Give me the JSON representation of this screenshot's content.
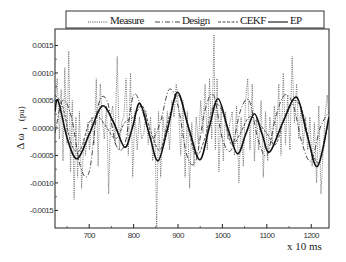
{
  "chart_data": {
    "type": "line",
    "title": "",
    "xlabel": "x 10 ms",
    "ylabel": "Δω 1 (pu)",
    "ylabel_main": "Δ ω",
    "ylabel_sub": "1",
    "ylabel_unit": "(pu)",
    "xlim": [
      623,
      1240
    ],
    "ylim": [
      -0.00182,
      0.0018
    ],
    "x_ticks": [
      700,
      800,
      900,
      1000,
      1100,
      1200
    ],
    "x_tick_labels": [
      "700",
      "800",
      "900",
      "1000",
      "1100",
      "1200"
    ],
    "y_ticks": [
      0.0015,
      0.001,
      0.0005,
      0.0,
      -0.0005,
      -0.001,
      -0.0015
    ],
    "y_tick_labels": [
      "0.0015",
      "0.0010",
      "0.0005",
      "0.0000",
      "-0.0005",
      "-0.0010",
      "-0.0015"
    ],
    "grid": false,
    "legend_position": "top",
    "series": [
      {
        "name": "Measure",
        "style": "dotted",
        "color": "#555555",
        "x": [
          623,
          628,
          633,
          637,
          641,
          645,
          650,
          654,
          658,
          662,
          666,
          670,
          674,
          678,
          683,
          688,
          692,
          697,
          701,
          706,
          711,
          716,
          720,
          725,
          730,
          734,
          739,
          744,
          748,
          753,
          758,
          763,
          768,
          773,
          778,
          783,
          788,
          793,
          798,
          803,
          808,
          813,
          818,
          823,
          828,
          833,
          838,
          843,
          848,
          852,
          856,
          861,
          866,
          871,
          876,
          881,
          886,
          891,
          896,
          901,
          906,
          911,
          916,
          921,
          926,
          931,
          936,
          941,
          946,
          951,
          956,
          961,
          966,
          971,
          976,
          981,
          984,
          988,
          992,
          997,
          1002,
          1007,
          1012,
          1017,
          1022,
          1027,
          1032,
          1037,
          1042,
          1047,
          1052,
          1057,
          1062,
          1067,
          1072,
          1077,
          1082,
          1087,
          1092,
          1097,
          1102,
          1107,
          1112,
          1117,
          1122,
          1127,
          1132,
          1137,
          1142,
          1147,
          1152,
          1157,
          1162,
          1167,
          1172,
          1177,
          1182,
          1187,
          1192,
          1197,
          1202,
          1207,
          1212,
          1217,
          1222,
          1227,
          1232,
          1236,
          1240
        ],
        "y": [
          0.0004,
          0.0009,
          -0.0002,
          0.0007,
          -0.0006,
          0.0011,
          -0.0003,
          0.0014,
          -0.0008,
          0.0005,
          -0.0013,
          0.0002,
          -0.0009,
          0.0003,
          -0.0011,
          -0.0002,
          -0.0005,
          0.0001,
          -0.0004,
          0.0002,
          -0.0003,
          0.0009,
          -0.0007,
          0.0008,
          0.0001,
          -0.0002,
          0.0004,
          -0.0012,
          0.0002,
          0.0004,
          -0.0003,
          0.0013,
          -0.0004,
          0.0001,
          0.0002,
          0.0009,
          -0.0005,
          0.001,
          -0.0009,
          0.0003,
          -0.0004,
          0.0002,
          -0.0002,
          -0.0001,
          0.0003,
          -0.0003,
          0.0002,
          -0.0006,
          0.0,
          -0.0018,
          0.0003,
          -0.0009,
          0.0002,
          -0.0002,
          0.0003,
          -0.0004,
          0.0005,
          0.0002,
          0.0008,
          0.0004,
          -0.0005,
          0.0005,
          -0.0009,
          0.0003,
          -0.0011,
          0.0001,
          -0.0007,
          0.0002,
          -0.0003,
          0.0005,
          -0.0001,
          0.0008,
          -0.0004,
          0.0009,
          -0.0002,
          0.0017,
          -0.0004,
          0.0009,
          -0.0008,
          0.0004,
          -0.0006,
          0.0003,
          -0.0002,
          0.0001,
          0.0003,
          -0.0005,
          0.0004,
          -0.001,
          0.0002,
          -0.0007,
          0.0005,
          0.0009,
          -0.0004,
          0.0008,
          -0.0006,
          0.0002,
          -0.0004,
          0.0005,
          -0.0009,
          0.0003,
          -0.0006,
          0.0002,
          -0.0003,
          0.0004,
          -0.0002,
          0.0008,
          -0.0005,
          0.001,
          -0.0003,
          0.0006,
          -0.0004,
          0.0013,
          0.0001,
          0.0008,
          -0.0002,
          0.0004,
          -0.0003,
          0.0002,
          -0.0004,
          0.0002,
          -0.0007,
          0.0001,
          -0.001,
          0.0004,
          -0.0012,
          -0.0004,
          0.0003,
          0.0006,
          0.0002
        ]
      },
      {
        "name": "Design",
        "style": "dash-dot",
        "color": "#333333",
        "x": [
          623,
          640,
          660,
          680,
          700,
          720,
          740,
          760,
          780,
          800,
          820,
          840,
          860,
          880,
          900,
          920,
          940,
          960,
          980,
          1000,
          1020,
          1040,
          1060,
          1080,
          1100,
          1120,
          1140,
          1160,
          1180,
          1200,
          1220,
          1240
        ],
        "y": [
          -0.0001,
          0.0005,
          0.0002,
          -0.0007,
          -0.0008,
          0.0004,
          0.0005,
          -0.0003,
          -0.0003,
          0.0006,
          0.0003,
          -0.0002,
          0.0001,
          0.0007,
          0.0004,
          -0.0005,
          -0.0006,
          0.0003,
          0.0006,
          -0.0002,
          -0.0004,
          0.0003,
          0.0005,
          -0.0002,
          -0.0005,
          0.0002,
          0.0006,
          0.0004,
          -0.0003,
          -0.0006,
          0.0,
          0.0003
        ]
      },
      {
        "name": "CEKF",
        "style": "dashed",
        "color": "#444444",
        "x": [
          623,
          640,
          660,
          680,
          700,
          720,
          740,
          760,
          780,
          800,
          820,
          840,
          860,
          880,
          900,
          920,
          940,
          960,
          980,
          1000,
          1020,
          1040,
          1060,
          1080,
          1100,
          1120,
          1140,
          1160,
          1180,
          1200,
          1220,
          1240
        ],
        "y": [
          0.0006,
          0.0004,
          -0.0003,
          -0.0004,
          0.0001,
          0.0002,
          0.0,
          -0.0002,
          0.0001,
          0.0002,
          0.0004,
          -0.0001,
          -0.0004,
          0.0002,
          0.0006,
          0.0001,
          -0.0005,
          -0.0002,
          0.0004,
          0.0003,
          -0.0003,
          -0.0001,
          0.0002,
          0.0001,
          -0.0001,
          -0.0003,
          0.0002,
          0.0005,
          0.0003,
          -0.0004,
          -0.0006,
          0.0002
        ]
      },
      {
        "name": "EP",
        "style": "solid",
        "color": "#111111",
        "x": [
          623,
          630,
          651,
          673,
          701,
          729,
          755,
          780,
          797,
          814,
          835,
          855,
          877,
          899,
          924,
          949,
          970,
          990,
          1012,
          1034,
          1053,
          1072,
          1089,
          1106,
          1136,
          1167,
          1190,
          1214,
          1240
        ],
        "y": [
          0.0003,
          0.0005,
          -0.0002,
          -0.00056,
          -0.0001,
          0.0004,
          0.0001,
          -0.00035,
          0.0,
          0.00045,
          -0.0001,
          -0.0006,
          0.0,
          0.00065,
          0.0,
          -0.00058,
          0.0,
          0.00053,
          0.0,
          -0.00047,
          -0.0001,
          0.00026,
          -0.0001,
          -0.00044,
          0.0001,
          0.00056,
          -0.0001,
          -0.0007,
          0.0002
        ]
      }
    ]
  },
  "legend": {
    "items": [
      {
        "label": "Measure",
        "style": "dotted"
      },
      {
        "label": "Design",
        "style": "dash-dot"
      },
      {
        "label": "CEKF",
        "style": "dashed"
      },
      {
        "label": "EP",
        "style": "solid"
      }
    ]
  },
  "axes": {
    "x_unit_label": "x 10 ms",
    "y_label_main": "Δ ω",
    "y_label_sub": "1",
    "y_label_unit": "(pu)"
  }
}
